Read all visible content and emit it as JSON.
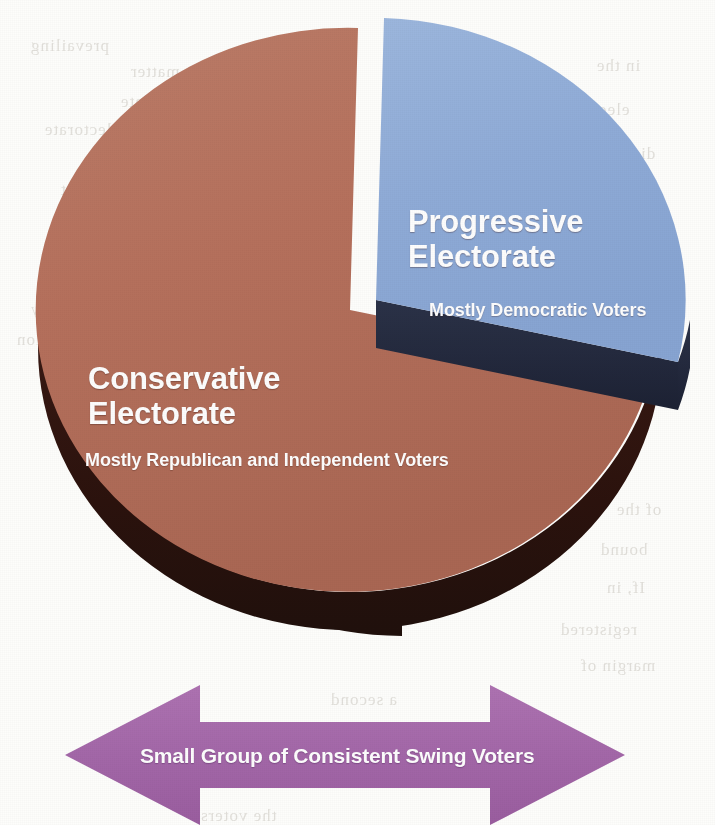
{
  "figure": {
    "kind": "exploded-3d-pie-chart",
    "background_color": "#fdfdfb"
  },
  "slices": {
    "progressive": {
      "label_line1": "Progressive",
      "label_line2": "Electorate",
      "sublabel": "Mostly Democratic Voters",
      "color": "#8fabd7",
      "side_color": "#23293d",
      "label_color": "#ffffff"
    },
    "conservative": {
      "label_line1": "Conservative",
      "label_line2": "Electorate",
      "sublabel": "Mostly Republican and Independent Voters",
      "color": "#b5705c",
      "side_color": "#2e1410",
      "label_color": "#ffffff"
    }
  },
  "arrow": {
    "label": "Small Group of Consistent Swing Voters",
    "color": "#a367a8",
    "label_color": "#ffffff",
    "direction": "double-headed-horizontal"
  },
  "bleed_through": [
    {
      "text": "prevailing",
      "x": 30,
      "y": 36
    },
    {
      "text": "the matter",
      "x": 130,
      "y": 62
    },
    {
      "text": "candidate",
      "x": 120,
      "y": 92
    },
    {
      "text": "electorate",
      "x": 44,
      "y": 120
    },
    {
      "text": "campaign",
      "x": 150,
      "y": 150
    },
    {
      "text": "turnout",
      "x": 60,
      "y": 180
    },
    {
      "text": "majority",
      "x": 30,
      "y": 300
    },
    {
      "text": "coalition",
      "x": 16,
      "y": 330
    },
    {
      "text": "in the",
      "x": 596,
      "y": 56
    },
    {
      "text": "elections",
      "x": 560,
      "y": 100
    },
    {
      "text": "district",
      "x": 600,
      "y": 144
    },
    {
      "text": "partisan",
      "x": 586,
      "y": 222
    },
    {
      "text": "of the",
      "x": 616,
      "y": 500
    },
    {
      "text": "bound",
      "x": 600,
      "y": 540
    },
    {
      "text": "If, in",
      "x": 606,
      "y": 578
    },
    {
      "text": "registered",
      "x": 560,
      "y": 620
    },
    {
      "text": "margin of",
      "x": 580,
      "y": 656
    },
    {
      "text": "a second",
      "x": 330,
      "y": 690
    },
    {
      "text": "the voters",
      "x": 200,
      "y": 806
    }
  ],
  "chart_data": {
    "type": "pie",
    "title": "",
    "categories": [
      "Conservative Electorate",
      "Progressive Electorate"
    ],
    "values": [
      66,
      34
    ],
    "value_unit": "percent of electorate",
    "labels": [
      "Conservative Electorate",
      "Progressive Electorate"
    ],
    "sublabels": [
      "Mostly Republican and Independent Voters",
      "Mostly Democratic Voters"
    ],
    "colors": [
      "#b5705c",
      "#8fabd7"
    ],
    "exploded": [
      "Progressive Electorate"
    ],
    "three_d": true,
    "legend": "none",
    "grid": false,
    "annotations": [
      {
        "type": "double-headed-arrow",
        "text": "Small Group of Consistent Swing Voters",
        "color": "#a367a8",
        "position": "below-pie"
      }
    ]
  }
}
